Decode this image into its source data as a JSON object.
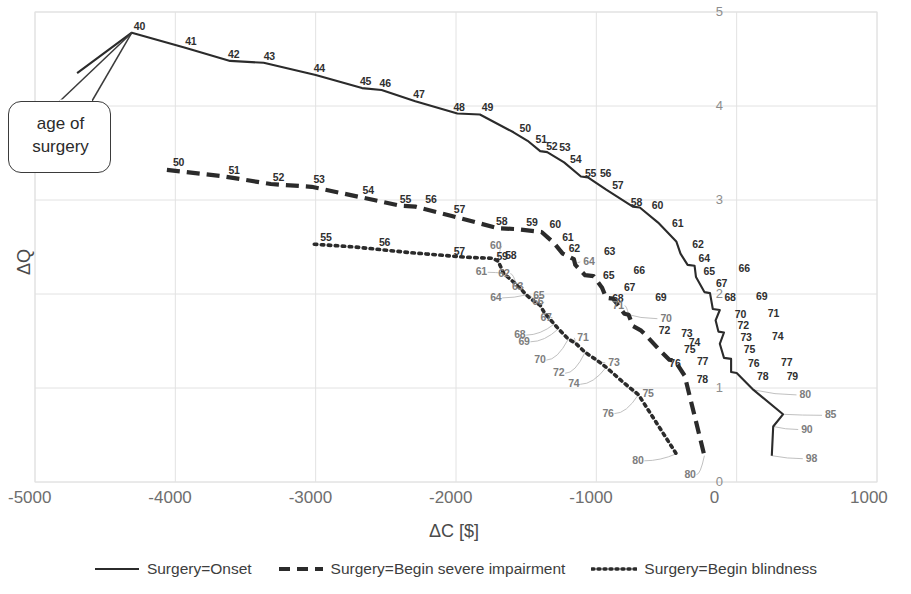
{
  "chart_data": {
    "type": "line",
    "title": "",
    "xlabel": "ΔC [$]",
    "ylabel": "ΔQ",
    "xlim": [
      -5000,
      1000
    ],
    "ylim": [
      0,
      5
    ],
    "xticks": [
      "-5000",
      "-4000",
      "-3000",
      "-2000",
      "-1000",
      "0",
      "1000"
    ],
    "xtick_values": [
      -5000,
      -4000,
      -3000,
      -2000,
      -1000,
      0,
      1000
    ],
    "yticks": [
      "5",
      "4",
      "3",
      "2",
      "1",
      "0"
    ],
    "ytick_values": [
      5,
      4,
      3,
      2,
      1,
      0
    ],
    "grid": true,
    "legend_position": "bottom",
    "annotation": "age of surgery",
    "point_label_meaning": "age of surgery (years)",
    "series": [
      {
        "name": "Surgery=Onset",
        "style": "solid",
        "color": "#2b2b2b",
        "points": [
          {
            "label": "",
            "x": -4700,
            "y": 4.35
          },
          {
            "label": "40",
            "x": -4310,
            "y": 4.78
          },
          {
            "label": "41",
            "x": -3930,
            "y": 4.62
          },
          {
            "label": "42",
            "x": -3610,
            "y": 4.48
          },
          {
            "label": "43",
            "x": -3370,
            "y": 4.46
          },
          {
            "label": "44",
            "x": -3000,
            "y": 4.33
          },
          {
            "label": "45",
            "x": -2670,
            "y": 4.19
          },
          {
            "label": "46",
            "x": -2530,
            "y": 4.17
          },
          {
            "label": "47",
            "x": -2290,
            "y": 4.05
          },
          {
            "label": "48",
            "x": -1990,
            "y": 3.92
          },
          {
            "label": "49",
            "x": -1830,
            "y": 3.91
          },
          {
            "label": "50",
            "x": -1590,
            "y": 3.72
          },
          {
            "label": "51",
            "x": -1490,
            "y": 3.63
          },
          {
            "label": "52",
            "x": -1400,
            "y": 3.52
          },
          {
            "label": "53",
            "x": -1350,
            "y": 3.51
          },
          {
            "label": "54",
            "x": -1230,
            "y": 3.4
          },
          {
            "label": "55",
            "x": -1110,
            "y": 3.25
          },
          {
            "label": "56",
            "x": -1060,
            "y": 3.24
          },
          {
            "label": "57",
            "x": -930,
            "y": 3.11
          },
          {
            "label": "58",
            "x": -740,
            "y": 2.93
          },
          {
            "label": "60",
            "x": -690,
            "y": 2.92
          },
          {
            "label": "61",
            "x": -560,
            "y": 2.76
          },
          {
            "label": "62",
            "x": -430,
            "y": 2.56
          },
          {
            "label": "64",
            "x": -400,
            "y": 2.43
          },
          {
            "label": "65",
            "x": -350,
            "y": 2.31
          },
          {
            "label": "66",
            "x": -300,
            "y": 2.3
          },
          {
            "label": "67",
            "x": -290,
            "y": 2.18
          },
          {
            "label": "68",
            "x": -230,
            "y": 2.02
          },
          {
            "label": "69",
            "x": -190,
            "y": 2.01
          },
          {
            "label": "70",
            "x": -170,
            "y": 1.84
          },
          {
            "label": "71",
            "x": -120,
            "y": 1.83
          },
          {
            "label": "72",
            "x": -150,
            "y": 1.72
          },
          {
            "label": "73",
            "x": -130,
            "y": 1.6
          },
          {
            "label": "74",
            "x": -90,
            "y": 1.59
          },
          {
            "label": "75",
            "x": -120,
            "y": 1.47
          },
          {
            "label": "76",
            "x": -90,
            "y": 1.32
          },
          {
            "label": "77",
            "x": -40,
            "y": 1.31
          },
          {
            "label": "78",
            "x": -40,
            "y": 1.17
          },
          {
            "label": "79",
            "x": 0,
            "y": 1.16
          },
          {
            "label": "80",
            "x": 120,
            "y": 0.98
          },
          {
            "label": "85",
            "x": 330,
            "y": 0.72
          },
          {
            "label": "90",
            "x": 260,
            "y": 0.59
          },
          {
            "label": "98",
            "x": 250,
            "y": 0.28
          }
        ]
      },
      {
        "name": "Surgery=Begin severe impairment",
        "style": "dashed",
        "color": "#2b2b2b",
        "points": [
          {
            "label": "50",
            "x": -4060,
            "y": 3.32
          },
          {
            "label": "51",
            "x": -3650,
            "y": 3.25
          },
          {
            "label": "52",
            "x": -3320,
            "y": 3.17
          },
          {
            "label": "53",
            "x": -3030,
            "y": 3.14
          },
          {
            "label": "54",
            "x": -2680,
            "y": 3.03
          },
          {
            "label": "55",
            "x": -2400,
            "y": 2.94
          },
          {
            "label": "56",
            "x": -2290,
            "y": 2.93
          },
          {
            "label": "57",
            "x": -2030,
            "y": 2.83
          },
          {
            "label": "58",
            "x": -1700,
            "y": 2.7
          },
          {
            "label": "59",
            "x": -1570,
            "y": 2.69
          },
          {
            "label": "60",
            "x": -1390,
            "y": 2.66
          },
          {
            "label": "61",
            "x": -1300,
            "y": 2.54
          },
          {
            "label": "62",
            "x": -1240,
            "y": 2.43
          },
          {
            "label": "63",
            "x": -1160,
            "y": 2.37
          },
          {
            "label": "64",
            "x": -1150,
            "y": 2.31
          },
          {
            "label": "65",
            "x": -1080,
            "y": 2.2
          },
          {
            "label": "66",
            "x": -1020,
            "y": 2.19
          },
          {
            "label": "67",
            "x": -960,
            "y": 2.07
          },
          {
            "label": "68",
            "x": -930,
            "y": 1.96
          },
          {
            "label": "69",
            "x": -880,
            "y": 1.95
          },
          {
            "label": "70",
            "x": -800,
            "y": 1.79
          },
          {
            "label": "71",
            "x": -770,
            "y": 1.78
          },
          {
            "label": "72",
            "x": -740,
            "y": 1.66
          },
          {
            "label": "73",
            "x": -680,
            "y": 1.61
          },
          {
            "label": "74",
            "x": -640,
            "y": 1.55
          },
          {
            "label": "75",
            "x": -560,
            "y": 1.42
          },
          {
            "label": "76",
            "x": -480,
            "y": 1.3
          },
          {
            "label": "77",
            "x": -440,
            "y": 1.29
          },
          {
            "label": "78",
            "x": -370,
            "y": 1.13
          },
          {
            "label": "80",
            "x": -230,
            "y": 0.28
          }
        ]
      },
      {
        "name": "Surgery=Begin blindness",
        "style": "dotted",
        "color": "#2b2b2b",
        "points": [
          {
            "label": "55",
            "x": -3010,
            "y": 2.53
          },
          {
            "label": "56",
            "x": -2720,
            "y": 2.5
          },
          {
            "label": "57",
            "x": -2330,
            "y": 2.44
          },
          {
            "label": "58",
            "x": -1920,
            "y": 2.39
          },
          {
            "label": "59",
            "x": -1740,
            "y": 2.38
          },
          {
            "label": "60",
            "x": -1700,
            "y": 2.35
          },
          {
            "label": "61",
            "x": -1660,
            "y": 2.22
          },
          {
            "label": "62",
            "x": -1570,
            "y": 2.1
          },
          {
            "label": "63",
            "x": -1530,
            "y": 2.04
          },
          {
            "label": "64",
            "x": -1500,
            "y": 1.99
          },
          {
            "label": "65",
            "x": -1450,
            "y": 1.93
          },
          {
            "label": "66",
            "x": -1400,
            "y": 1.88
          },
          {
            "label": "67",
            "x": -1370,
            "y": 1.8
          },
          {
            "label": "68",
            "x": -1300,
            "y": 1.68
          },
          {
            "label": "69",
            "x": -1270,
            "y": 1.63
          },
          {
            "label": "70",
            "x": -1200,
            "y": 1.52
          },
          {
            "label": "71",
            "x": -1150,
            "y": 1.48
          },
          {
            "label": "72",
            "x": -1080,
            "y": 1.38
          },
          {
            "label": "73",
            "x": -1000,
            "y": 1.3
          },
          {
            "label": "74",
            "x": -930,
            "y": 1.22
          },
          {
            "label": "75",
            "x": -800,
            "y": 1.05
          },
          {
            "label": "76",
            "x": -700,
            "y": 0.93
          },
          {
            "label": "80",
            "x": -430,
            "y": 0.3
          }
        ]
      }
    ]
  },
  "axes": {
    "x_title": "ΔC [$]",
    "y_title": "ΔQ",
    "x_ticks": [
      "-5000",
      "-4000",
      "-3000",
      "-2000",
      "-1000",
      "0",
      "1000"
    ],
    "y_ticks": [
      "5",
      "4",
      "3",
      "2",
      "1",
      "0"
    ]
  },
  "callout": {
    "line1": "age of",
    "line2": "surgery",
    "text": "age of surgery"
  },
  "legend": {
    "items": [
      {
        "label": "Surgery=Onset",
        "style": "solid"
      },
      {
        "label": "Surgery=Begin severe impairment",
        "style": "dashed"
      },
      {
        "label": "Surgery=Begin blindness",
        "style": "dotted"
      }
    ]
  },
  "colors": {
    "line": "#2b2b2b",
    "grid": "#e2e2e2",
    "tick_text": "#6e6e6e",
    "label_text": "#2f2f2f",
    "leader": "#b9b9b9"
  }
}
